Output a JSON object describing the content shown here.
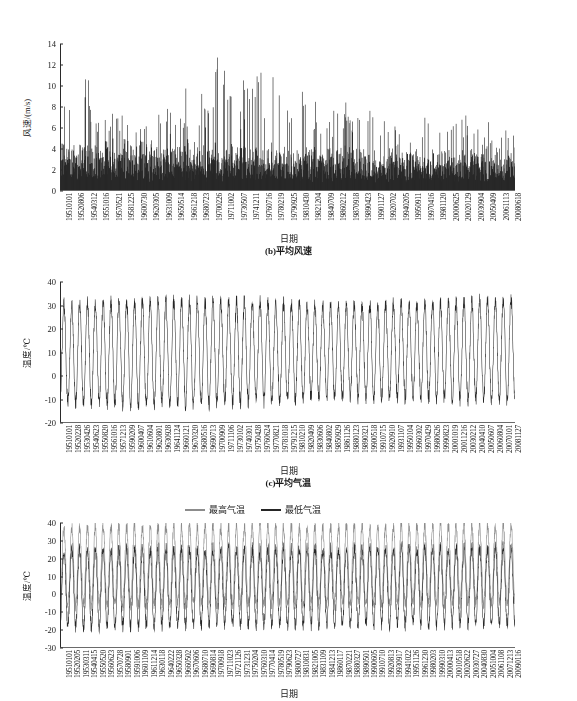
{
  "page": {
    "background": "#ffffff",
    "ink": "#1a1a1a"
  },
  "figures": [
    {
      "id": "fig-a",
      "caption": "(b)平均风速",
      "xlabel": "日期",
      "ylabel": "风速/(m/s)",
      "chart_data": {
        "type": "area",
        "title": "",
        "xlabel": "日期",
        "ylabel": "风速/(m/s)",
        "ylim": [
          0,
          14
        ],
        "yticks": [
          0,
          2,
          4,
          6,
          8,
          10,
          12,
          14
        ],
        "grid": false,
        "legend": "none",
        "series_color": "#262626",
        "categories": [
          "19510101",
          "19520806",
          "19540312",
          "19551016",
          "19570521",
          "19581225",
          "19600730",
          "19620305",
          "19631009",
          "19650514",
          "19661218",
          "19680723",
          "19700226",
          "19711002",
          "19730507",
          "19741211",
          "19760716",
          "19780219",
          "19790925",
          "19810430",
          "19821204",
          "19840709",
          "19860212",
          "19870918",
          "19890423",
          "19901127",
          "19920702",
          "19940205",
          "19950911",
          "19970416",
          "19981120",
          "20000625",
          "20020129",
          "20030904",
          "20050409",
          "20061113",
          "20080618"
        ],
        "note": "Daily mean wind speed, 1951-2009; dense spiky series, baseline near 0.5-4 m/s with peaks to 13.3 m/s. Highest peaks cluster 1954, 1968-1975 and 1976-1980; amplitude declines after 1985.",
        "envelope_peaks": [
          9.1,
          10.3,
          9.5,
          13.1,
          8.7,
          9.5,
          7.9,
          8.0,
          7.7,
          6.9,
          6.8,
          8.4,
          10.0,
          8.9,
          9.4,
          11.5,
          10.9,
          10.8,
          13.3,
          12.6,
          12.9,
          11.2,
          11.4,
          12.6,
          9.9,
          11.8,
          10.9,
          11.5,
          10.3,
          11.8,
          9.6,
          8.8,
          9.0,
          8.6,
          8.2,
          7.9,
          9.1,
          8.8,
          7.0,
          6.8,
          7.4,
          7.3,
          7.7,
          8.2,
          6.9,
          7.1,
          7.3,
          7.5,
          6.6,
          6.7,
          7.1,
          6.8,
          6.9,
          7.0
        ],
        "values_min": 0.0,
        "values_max": 13.3
      }
    },
    {
      "id": "fig-b",
      "caption": "(c)平均气温",
      "xlabel": "日期",
      "ylabel": "温度/℃",
      "chart_data": {
        "type": "line",
        "title": "",
        "xlabel": "日期",
        "ylabel": "温度/℃",
        "ylim": [
          -20,
          40
        ],
        "yticks": [
          -20,
          -10,
          0,
          10,
          20,
          30,
          40
        ],
        "grid": false,
        "legend": "none",
        "series_color": "#262626",
        "categories": [
          "19510101",
          "19520228",
          "19530426",
          "19540623",
          "19550820",
          "19561016",
          "19571213",
          "19590209",
          "19600407",
          "19610604",
          "19620801",
          "19630928",
          "19641124",
          "19660121",
          "19670320",
          "19680516",
          "19690713",
          "19700909",
          "19711106",
          "19730102",
          "19740301",
          "19750428",
          "19760624",
          "19770821",
          "19781018",
          "19791215",
          "19810210",
          "19820409",
          "19830606",
          "19840802",
          "19850929",
          "19861126",
          "19880123",
          "19890321",
          "19900518",
          "19910715",
          "19920910",
          "19931107",
          "19950104",
          "19960302",
          "19970429",
          "19980626",
          "19990823",
          "20001019",
          "20011216",
          "20030212",
          "20040410",
          "20050607",
          "20060804",
          "20070101",
          "20081127"
        ],
        "note": "Daily mean air temperature 1951-2009; strong annual sinusoid, summer peaks ~30-33 °C, winter troughs ~-10 to -16 °C, annual mean near 10 °C. Slight warming trend after 1990.",
        "annual_max_typical": 31,
        "annual_min_typical": -12,
        "values_min": -16,
        "values_max": 35
      }
    },
    {
      "id": "fig-c",
      "caption": "",
      "xlabel": "日期",
      "ylabel": "温度/℃",
      "legend": {
        "position": "top-center",
        "items": [
          {
            "label": "最高气温",
            "color": "#8c8c8c"
          },
          {
            "label": "最低气温",
            "color": "#262626"
          }
        ]
      },
      "chart_data": {
        "type": "line",
        "title": "",
        "xlabel": "日期",
        "ylabel": "温度/℃",
        "ylim": [
          -30,
          40
        ],
        "yticks": [
          -30,
          -20,
          -10,
          0,
          10,
          20,
          30,
          40
        ],
        "grid": false,
        "legend": "top-center",
        "series": [
          {
            "name": "最高气温",
            "color": "#8c8c8c",
            "annual_max_typical": 38,
            "annual_min_typical": -6,
            "values_min": -10,
            "values_max": 41
          },
          {
            "name": "最低气温",
            "color": "#262626",
            "annual_max_typical": 25,
            "annual_min_typical": -18,
            "values_min": -22,
            "values_max": 28
          }
        ],
        "categories": [
          "19510101",
          "19520205",
          "19530311",
          "19540415",
          "19550520",
          "19560623",
          "19570728",
          "19580901",
          "19591006",
          "19601109",
          "19611214",
          "19630118",
          "19640222",
          "19650328",
          "19660502",
          "19670606",
          "19680710",
          "19690814",
          "19700918",
          "19711023",
          "19721126",
          "19731231",
          "19750204",
          "19760310",
          "19770414",
          "19780519",
          "19790623",
          "19800727",
          "19810831",
          "19821005",
          "19831109",
          "19841213",
          "19860117",
          "19870221",
          "19880327",
          "19890501",
          "19900605",
          "19910710",
          "19920813",
          "19930917",
          "19941022",
          "19951126",
          "19961230",
          "19980203",
          "19990310",
          "20000413",
          "20010518",
          "20020622",
          "20030727",
          "20040830",
          "20051004",
          "20061108",
          "20071213",
          "20090116"
        ],
        "note": "Daily max and min air temperature 1951-2009; both series show strong annual cycles, max series (gray) above min series (dark)."
      }
    }
  ]
}
